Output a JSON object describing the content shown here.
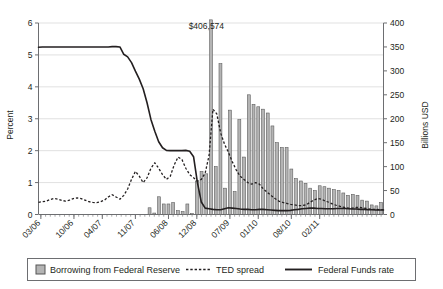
{
  "chart_data": {
    "type": "bar",
    "title": "",
    "subtitle": "",
    "xlabel": "",
    "ylabel": "Percent",
    "y2label": "Billions USD",
    "ylim": [
      0,
      6
    ],
    "y2lim": [
      0,
      400
    ],
    "yticks": [
      "0",
      "1",
      "2",
      "3",
      "4",
      "5",
      "6"
    ],
    "ytick_values": [
      0,
      1,
      2,
      3,
      4,
      5,
      6
    ],
    "y2ticks": [
      "0",
      "50",
      "100",
      "150",
      "200",
      "250",
      "300",
      "350",
      "400"
    ],
    "y2tick_values": [
      0,
      50,
      100,
      150,
      200,
      250,
      300,
      350,
      400
    ],
    "grid": "horizontal",
    "legend_position": "bottom",
    "xtick_labels": [
      "03/06",
      "10/06",
      "04/07",
      "11/07",
      "06/08",
      "12/08",
      "07/09",
      "01/10",
      "08/10",
      "02/11"
    ],
    "xtick_indices": [
      0,
      7,
      13,
      20,
      27,
      33,
      40,
      46,
      53,
      59
    ],
    "annotations": [
      {
        "text": "$406,574",
        "series": "Borrowing from Federal Reserve",
        "x_index": 30,
        "value": 406.574,
        "axis": "right"
      }
    ],
    "series": [
      {
        "name": "Borrowing from Federal Reserve",
        "type": "bar",
        "axis": "right",
        "units": "Billions USD",
        "color": "#b4b4b4",
        "edge_color": "#555555",
        "values": [
          0,
          0,
          0,
          0,
          0,
          0,
          0,
          0,
          0,
          0,
          0,
          0,
          0,
          0,
          0,
          0,
          0,
          0,
          0,
          0,
          0,
          0,
          0,
          14,
          3,
          37,
          22,
          22,
          25,
          8,
          6,
          22,
          2,
          70,
          90,
          85,
          406.574,
          100,
          315,
          55,
          218,
          48,
          198,
          120,
          250,
          230,
          225,
          220,
          212,
          185,
          150,
          140,
          140,
          95,
          75,
          70,
          65,
          55,
          50,
          60,
          58,
          55,
          52,
          50,
          45,
          40,
          42,
          40,
          30,
          28,
          20,
          18,
          25
        ],
        "peak_value": 406.574,
        "peak_label": "$406,574"
      },
      {
        "name": "TED spread",
        "type": "line",
        "style": "dotted",
        "axis": "left",
        "units": "Percent",
        "color": "#231f20",
        "values": [
          0.38,
          0.4,
          0.42,
          0.47,
          0.5,
          0.48,
          0.44,
          0.42,
          0.45,
          0.5,
          0.52,
          0.5,
          0.45,
          0.4,
          0.38,
          0.37,
          0.4,
          0.45,
          0.55,
          0.62,
          0.55,
          0.48,
          0.6,
          0.8,
          1.1,
          1.35,
          1.2,
          1.0,
          1.15,
          1.45,
          1.62,
          1.45,
          1.25,
          1.1,
          1.2,
          1.55,
          1.8,
          1.72,
          1.45,
          1.25,
          1.15,
          1.05,
          1.1,
          1.3,
          1.85,
          3.3,
          3.15,
          2.55,
          2.2,
          1.95,
          1.65,
          1.4,
          1.2,
          1.1,
          1.0,
          0.95,
          1.0,
          0.95,
          0.8,
          0.7,
          0.6,
          0.5,
          0.42,
          0.38,
          0.35,
          0.32,
          0.3,
          0.28,
          0.28,
          0.3,
          0.38,
          0.45,
          0.5,
          0.48,
          0.42,
          0.38,
          0.32,
          0.28,
          0.25,
          0.22,
          0.2,
          0.2,
          0.22,
          0.22,
          0.2,
          0.18,
          0.16,
          0.16,
          0.15,
          0.15
        ]
      },
      {
        "name": "Federal Funds rate",
        "type": "line",
        "style": "solid",
        "axis": "left",
        "units": "Percent",
        "color": "#231f20",
        "values": [
          5.24,
          5.25,
          5.25,
          5.25,
          5.25,
          5.25,
          5.25,
          5.25,
          5.25,
          5.25,
          5.25,
          5.25,
          5.25,
          5.25,
          5.25,
          5.25,
          5.25,
          5.25,
          5.25,
          5.26,
          5.26,
          5.25,
          5.02,
          4.94,
          4.76,
          4.49,
          4.24,
          3.94,
          3.5,
          2.98,
          2.61,
          2.28,
          2.09,
          2.01,
          2.0,
          2.0,
          2.0,
          2.0,
          2.01,
          1.98,
          1.81,
          1.0,
          0.39,
          0.2,
          0.18,
          0.16,
          0.15,
          0.15,
          0.18,
          0.21,
          0.2,
          0.19,
          0.17,
          0.16,
          0.16,
          0.15,
          0.15,
          0.16,
          0.16,
          0.15,
          0.14,
          0.13,
          0.12,
          0.12,
          0.12,
          0.13,
          0.15,
          0.16,
          0.18,
          0.19,
          0.2,
          0.2,
          0.19,
          0.19,
          0.18,
          0.18,
          0.18,
          0.19,
          0.19,
          0.19,
          0.18,
          0.17,
          0.17,
          0.16,
          0.16,
          0.15,
          0.15,
          0.14,
          0.14,
          0.14
        ]
      }
    ]
  },
  "axes": {
    "left": {
      "title": "Percent",
      "ticks": [
        "0",
        "1",
        "2",
        "3",
        "4",
        "5",
        "6"
      ]
    },
    "right": {
      "title": "Billions USD",
      "ticks": [
        "0",
        "50",
        "100",
        "150",
        "200",
        "250",
        "300",
        "350",
        "400"
      ]
    },
    "bottom": {
      "ticks": [
        "03/06",
        "10/06",
        "04/07",
        "11/07",
        "06/08",
        "12/08",
        "07/09",
        "01/10",
        "08/10",
        "02/11"
      ]
    }
  },
  "annotation": {
    "peak_value_label": "$406,574"
  },
  "legend": {
    "items": [
      {
        "label": "Borrowing from Federal Reserve",
        "marker": "square-swatch",
        "color": "#b4b4b4"
      },
      {
        "label": "TED spread",
        "marker": "dotted-line",
        "color": "#231f20"
      },
      {
        "label": "Federal Funds rate",
        "marker": "solid-line",
        "color": "#231f20"
      }
    ]
  },
  "colors": {
    "bar_fill": "#b4b4b4",
    "bar_edge": "#555555",
    "line": "#231f20",
    "grid": "#d9d9d9",
    "axis": "#6d6e71",
    "text": "#231f20",
    "background": "#ffffff"
  }
}
